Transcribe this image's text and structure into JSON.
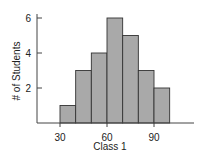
{
  "chart_data": {
    "type": "bar",
    "subtype": "histogram",
    "title": "",
    "xlabel": "Class 1",
    "ylabel": "# of Students",
    "bins": [
      {
        "start": 30,
        "end": 40,
        "count": 1
      },
      {
        "start": 40,
        "end": 50,
        "count": 3
      },
      {
        "start": 50,
        "end": 60,
        "count": 4
      },
      {
        "start": 60,
        "end": 70,
        "count": 6
      },
      {
        "start": 70,
        "end": 80,
        "count": 5
      },
      {
        "start": 80,
        "end": 90,
        "count": 3
      },
      {
        "start": 90,
        "end": 100,
        "count": 2
      }
    ],
    "categories": [
      "30-40",
      "40-50",
      "50-60",
      "60-70",
      "70-80",
      "80-90",
      "90-100"
    ],
    "values": [
      1,
      3,
      4,
      6,
      5,
      3,
      2
    ],
    "xticks": [
      30,
      60,
      90
    ],
    "yticks": [
      2,
      4,
      6
    ],
    "xlim": [
      15,
      115
    ],
    "ylim": [
      0,
      6.5
    ],
    "grid": false,
    "legend": null,
    "colors": {
      "bar_fill": "#a9a9a9",
      "bar_edge": "#333333",
      "axis": "#444444"
    }
  }
}
